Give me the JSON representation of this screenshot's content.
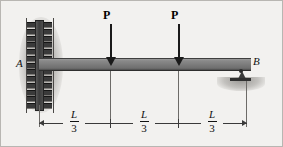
{
  "figure": {
    "background_color": "#f2f1ef",
    "beam_color": "#7c7c7c",
    "line_color": "#3a3a3a"
  },
  "supports": [
    {
      "id": "A",
      "label": "A",
      "type": "fixed-support",
      "position": "left"
    },
    {
      "id": "B",
      "label": "B",
      "type": "pin-support",
      "position": "right"
    }
  ],
  "loads": [
    {
      "id": "load-1",
      "label": "P",
      "direction": "down",
      "location": "L/3 from A"
    },
    {
      "id": "load-2",
      "label": "P",
      "direction": "down",
      "location": "2L/3 from A"
    }
  ],
  "dimensions": [
    {
      "id": "dim-1",
      "numerator": "L",
      "denominator": "3"
    },
    {
      "id": "dim-2",
      "numerator": "L",
      "denominator": "3"
    },
    {
      "id": "dim-3",
      "numerator": "L",
      "denominator": "3"
    }
  ]
}
